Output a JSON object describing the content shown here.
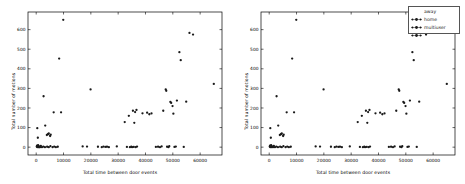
{
  "figure": {
    "background": "#ffffff",
    "marker_color": "#1a1a1a",
    "axis_color": "#000000"
  },
  "legend": {
    "position": "right",
    "border_color": "#555555",
    "entries": [
      {
        "label": "away",
        "marker": "dot-line-marker",
        "color": "#1a1a1a"
      },
      {
        "label": "home",
        "marker": "dot-line-marker",
        "color": "#1a1a1a"
      },
      {
        "label": "multiuser",
        "marker": "dot-line-marker",
        "color": "#1a1a1a"
      }
    ]
  },
  "chart_data": [
    {
      "type": "scatter",
      "title": "",
      "xlabel": "Total time between door events",
      "ylabel": "Total number of motions",
      "xlim": [
        -3000,
        68000
      ],
      "ylim": [
        -40,
        690
      ],
      "xticks": [
        0,
        10000,
        20000,
        30000,
        40000,
        50000,
        60000
      ],
      "xticklabels": [
        "0",
        "10000",
        "20000",
        "30000",
        "40000",
        "50000",
        "60000"
      ],
      "yticks": [
        0,
        100,
        200,
        300,
        400,
        500,
        600
      ],
      "yticklabels": [
        "0",
        "100",
        "200",
        "300",
        "400",
        "500",
        "600"
      ],
      "grid": false,
      "legend": false,
      "series": [
        {
          "name": "all",
          "color": "#1a1a1a",
          "points": [
            [
              200,
              3
            ],
            [
              300,
              8
            ],
            [
              400,
              0
            ],
            [
              500,
              5
            ],
            [
              600,
              2
            ],
            [
              700,
              10
            ],
            [
              900,
              0
            ],
            [
              1100,
              4
            ],
            [
              1400,
              0
            ],
            [
              1700,
              6
            ],
            [
              2100,
              0
            ],
            [
              2600,
              3
            ],
            [
              3200,
              0
            ],
            [
              4000,
              2
            ],
            [
              4600,
              0
            ],
            [
              5200,
              5
            ],
            [
              6000,
              0
            ],
            [
              6600,
              3
            ],
            [
              7200,
              0
            ],
            [
              7900,
              2
            ],
            [
              400,
              97
            ],
            [
              600,
              48
            ],
            [
              1100,
              0
            ],
            [
              2700,
              260
            ],
            [
              3300,
              110
            ],
            [
              3900,
              62
            ],
            [
              4300,
              66
            ],
            [
              4600,
              70
            ],
            [
              5100,
              57
            ],
            [
              5300,
              64
            ],
            [
              6400,
              178
            ],
            [
              8400,
              452
            ],
            [
              9100,
              178
            ],
            [
              9900,
              650
            ],
            [
              17000,
              4
            ],
            [
              18600,
              3
            ],
            [
              19900,
              295
            ],
            [
              22600,
              2
            ],
            [
              24000,
              0
            ],
            [
              24600,
              3
            ],
            [
              25300,
              1
            ],
            [
              25900,
              2
            ],
            [
              26600,
              0
            ],
            [
              29500,
              4
            ],
            [
              32400,
              128
            ],
            [
              33200,
              1
            ],
            [
              33900,
              160
            ],
            [
              34300,
              0
            ],
            [
              34800,
              2
            ],
            [
              35100,
              0
            ],
            [
              35400,
              186
            ],
            [
              35700,
              1
            ],
            [
              35900,
              124
            ],
            [
              36200,
              179
            ],
            [
              36400,
              0
            ],
            [
              36700,
              190
            ],
            [
              36900,
              3
            ],
            [
              38900,
              173
            ],
            [
              40600,
              176
            ],
            [
              41400,
              168
            ],
            [
              42200,
              172
            ],
            [
              43800,
              1
            ],
            [
              44600,
              2
            ],
            [
              45300,
              0
            ],
            [
              45900,
              4
            ],
            [
              46500,
              186
            ],
            [
              47400,
              295
            ],
            [
              47600,
              288
            ],
            [
              47900,
              2
            ],
            [
              48400,
              0
            ],
            [
              48700,
              5
            ],
            [
              49100,
              231
            ],
            [
              49400,
              226
            ],
            [
              49900,
              210
            ],
            [
              50200,
              171
            ],
            [
              50600,
              1
            ],
            [
              51100,
              3
            ],
            [
              51500,
              238
            ],
            [
              52400,
              485
            ],
            [
              52900,
              444
            ],
            [
              54000,
              1
            ],
            [
              54900,
              232
            ],
            [
              56100,
              583
            ],
            [
              57400,
              575
            ],
            [
              65000,
              323
            ]
          ]
        }
      ]
    },
    {
      "type": "scatter",
      "title": "",
      "xlabel": "Total time between door events",
      "ylabel": "Total number of motions",
      "xlim": [
        -3000,
        68000
      ],
      "ylim": [
        -40,
        690
      ],
      "xticks": [
        0,
        10000,
        20000,
        30000,
        40000,
        50000,
        60000
      ],
      "xticklabels": [
        "0",
        "10000",
        "20000",
        "30000",
        "40000",
        "50000",
        "60000"
      ],
      "yticks": [
        0,
        100,
        200,
        300,
        400,
        500,
        600
      ],
      "yticklabels": [
        "0",
        "100",
        "200",
        "300",
        "400",
        "500",
        "600"
      ],
      "grid": false,
      "legend": true,
      "series": [
        {
          "name": "away",
          "color": "#1a1a1a",
          "points": [
            [
              200,
              3
            ],
            [
              300,
              8
            ],
            [
              400,
              0
            ],
            [
              500,
              5
            ],
            [
              600,
              2
            ],
            [
              700,
              10
            ],
            [
              900,
              0
            ],
            [
              1100,
              4
            ],
            [
              1400,
              0
            ],
            [
              1700,
              6
            ],
            [
              2100,
              0
            ],
            [
              2600,
              3
            ],
            [
              3200,
              0
            ],
            [
              4000,
              2
            ],
            [
              4600,
              0
            ],
            [
              5200,
              5
            ],
            [
              6000,
              0
            ],
            [
              6600,
              3
            ],
            [
              7200,
              0
            ],
            [
              7900,
              2
            ],
            [
              17000,
              4
            ],
            [
              18600,
              3
            ],
            [
              22600,
              2
            ],
            [
              24000,
              0
            ],
            [
              24600,
              3
            ],
            [
              25300,
              1
            ],
            [
              25900,
              2
            ],
            [
              26600,
              0
            ],
            [
              29500,
              4
            ],
            [
              33200,
              1
            ],
            [
              34300,
              0
            ],
            [
              34800,
              2
            ],
            [
              35100,
              0
            ],
            [
              35700,
              1
            ],
            [
              36400,
              0
            ],
            [
              36900,
              3
            ],
            [
              43800,
              1
            ],
            [
              44600,
              2
            ],
            [
              45300,
              0
            ],
            [
              45900,
              4
            ],
            [
              47900,
              2
            ],
            [
              48400,
              0
            ],
            [
              48700,
              5
            ],
            [
              50600,
              1
            ],
            [
              51100,
              3
            ],
            [
              54000,
              1
            ]
          ]
        },
        {
          "name": "home",
          "color": "#1a1a1a",
          "points": [
            [
              400,
              97
            ],
            [
              600,
              48
            ],
            [
              2700,
              260
            ],
            [
              3300,
              110
            ],
            [
              3900,
              62
            ],
            [
              4300,
              66
            ],
            [
              4600,
              70
            ],
            [
              5100,
              57
            ],
            [
              5300,
              64
            ],
            [
              6400,
              178
            ],
            [
              9100,
              178
            ],
            [
              19900,
              295
            ],
            [
              32400,
              128
            ],
            [
              33900,
              160
            ],
            [
              35400,
              186
            ],
            [
              35900,
              124
            ],
            [
              36200,
              179
            ],
            [
              36700,
              190
            ],
            [
              38900,
              173
            ],
            [
              40600,
              176
            ],
            [
              41400,
              168
            ],
            [
              42200,
              172
            ],
            [
              46500,
              186
            ],
            [
              49100,
              231
            ],
            [
              49400,
              226
            ],
            [
              49900,
              210
            ],
            [
              50200,
              171
            ],
            [
              51500,
              238
            ],
            [
              54900,
              232
            ]
          ]
        },
        {
          "name": "multiuser",
          "color": "#1a1a1a",
          "points": [
            [
              8400,
              452
            ],
            [
              9900,
              650
            ],
            [
              47400,
              295
            ],
            [
              47600,
              288
            ],
            [
              52400,
              485
            ],
            [
              52900,
              444
            ],
            [
              56100,
              583
            ],
            [
              57400,
              575
            ],
            [
              65000,
              323
            ]
          ]
        }
      ]
    }
  ]
}
